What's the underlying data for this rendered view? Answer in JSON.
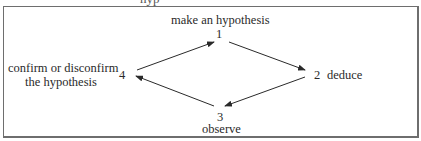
{
  "figure": {
    "cropped_top_text": "hyp",
    "diagram_type": "cycle",
    "nodes": [
      {
        "id": "1",
        "number": "1",
        "label": "make an hypothesis",
        "position": "top"
      },
      {
        "id": "2",
        "number": "2",
        "label": "deduce",
        "position": "right"
      },
      {
        "id": "3",
        "number": "3",
        "label": "observe",
        "position": "bottom"
      },
      {
        "id": "4",
        "number": "4",
        "label_line1": "confirm or disconfirm",
        "label_line2": "the hypothesis",
        "position": "left"
      }
    ],
    "edges": [
      {
        "from": "1",
        "to": "2"
      },
      {
        "from": "2",
        "to": "3"
      },
      {
        "from": "3",
        "to": "4"
      },
      {
        "from": "4",
        "to": "1"
      }
    ],
    "colors": {
      "line": "#2a2a2a",
      "frame": "#6e6e6e",
      "background": "#ffffff"
    }
  }
}
